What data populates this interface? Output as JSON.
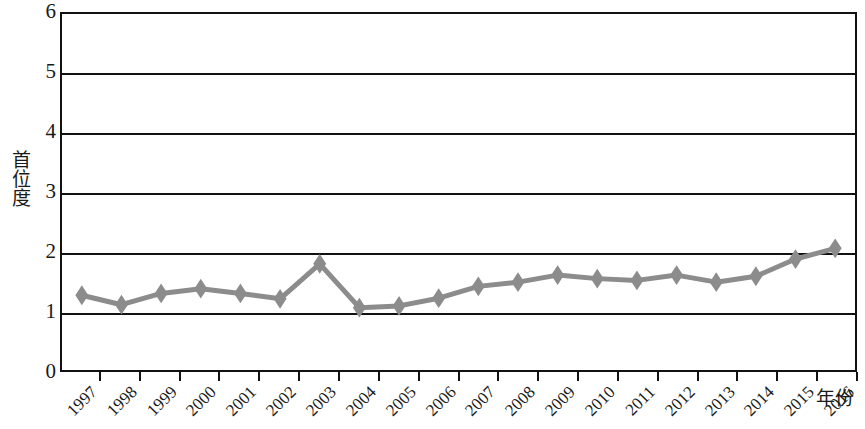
{
  "chart_data": {
    "type": "line",
    "title": "",
    "subtitle": "",
    "xlabel": "年份",
    "ylabel": "首位度",
    "categories": [
      "1997",
      "1998",
      "1999",
      "2000",
      "2001",
      "2002",
      "2003",
      "2004",
      "2005",
      "2006",
      "2007",
      "2008",
      "2009",
      "2010",
      "2011",
      "2012",
      "2013",
      "2014",
      "2015",
      "2016"
    ],
    "values": [
      1.26,
      1.1,
      1.29,
      1.37,
      1.29,
      1.2,
      1.79,
      1.05,
      1.08,
      1.21,
      1.41,
      1.48,
      1.6,
      1.54,
      1.51,
      1.6,
      1.48,
      1.58,
      1.87,
      2.05
    ],
    "series": [
      {
        "name": "首位度",
        "values": [
          1.26,
          1.1,
          1.29,
          1.37,
          1.29,
          1.2,
          1.79,
          1.05,
          1.08,
          1.21,
          1.41,
          1.48,
          1.6,
          1.54,
          1.51,
          1.6,
          1.48,
          1.58,
          1.87,
          2.05
        ]
      }
    ],
    "ylim": [
      0,
      6
    ],
    "y_ticks": [
      0,
      1,
      2,
      3,
      4,
      5,
      6
    ],
    "grid": true,
    "legend": "none",
    "marker": "diamond",
    "line_color": "#8c8c8c",
    "marker_color": "#8c8c8c",
    "axis_color": "#111111",
    "background": "#ffffff"
  },
  "axes": {
    "y_title": "首位度",
    "x_title": "年份",
    "y_tick_labels": [
      "6",
      "5",
      "4",
      "3",
      "2",
      "1",
      "0"
    ],
    "x_tick_labels": [
      "1997",
      "1998",
      "1999",
      "2000",
      "2001",
      "2002",
      "2003",
      "2004",
      "2005",
      "2006",
      "2007",
      "2008",
      "2009",
      "2010",
      "2011",
      "2012",
      "2013",
      "2014",
      "2015",
      "2016"
    ]
  }
}
